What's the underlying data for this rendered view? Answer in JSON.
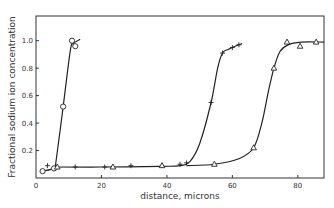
{
  "chart_data": {
    "type": "scatter",
    "title": "",
    "xlabel": "distance, microns",
    "ylabel": "Fractional sodium ion concentration",
    "xlim": [
      0,
      88
    ],
    "ylim": [
      0,
      1.18
    ],
    "xticks": [
      0,
      20,
      40,
      60,
      80
    ],
    "xtick_labels": [
      "0",
      "20",
      "40",
      "60",
      "80"
    ],
    "yticks": [
      0.2,
      0.4,
      0.6,
      0.8,
      1.0
    ],
    "ytick_labels": [
      "0.2",
      "0.4",
      "0.6",
      "0.8",
      "1.0"
    ],
    "grid": false,
    "legend": null,
    "series": [
      {
        "name": "circles",
        "marker": "circle",
        "points": [
          [
            2,
            0.05
          ],
          [
            5.5,
            0.07
          ],
          [
            8.3,
            0.52
          ],
          [
            11,
            1.0
          ],
          [
            12,
            0.96
          ]
        ],
        "curve": [
          [
            2,
            0.05
          ],
          [
            5.5,
            0.07
          ],
          [
            6,
            0.1
          ],
          [
            8.3,
            0.52
          ],
          [
            10.5,
            0.93
          ],
          [
            11.5,
            0.98
          ],
          [
            13.5,
            1.01
          ]
        ]
      },
      {
        "name": "crosses",
        "marker": "plus",
        "points": [
          [
            3.5,
            0.09
          ],
          [
            12,
            0.08
          ],
          [
            21,
            0.08
          ],
          [
            29,
            0.09
          ],
          [
            44,
            0.1
          ],
          [
            46,
            0.11
          ],
          [
            53.5,
            0.55
          ],
          [
            57,
            0.91
          ],
          [
            60,
            0.95
          ],
          [
            62,
            0.97
          ]
        ],
        "curve": [
          [
            6,
            0.08
          ],
          [
            20,
            0.08
          ],
          [
            38,
            0.085
          ],
          [
            44,
            0.09
          ],
          [
            47,
            0.12
          ],
          [
            50,
            0.25
          ],
          [
            53.5,
            0.55
          ],
          [
            55.5,
            0.8
          ],
          [
            57,
            0.91
          ],
          [
            59,
            0.94
          ],
          [
            63,
            0.98
          ]
        ]
      },
      {
        "name": "triangles",
        "marker": "triangle",
        "points": [
          [
            6.5,
            0.08
          ],
          [
            23.5,
            0.08
          ],
          [
            38.5,
            0.09
          ],
          [
            54.5,
            0.1
          ],
          [
            66.5,
            0.22
          ],
          [
            72.7,
            0.8
          ],
          [
            76.7,
            0.99
          ],
          [
            80.7,
            0.96
          ],
          [
            85.6,
            0.99
          ]
        ],
        "curve": [
          [
            46,
            0.09
          ],
          [
            54.5,
            0.1
          ],
          [
            62,
            0.14
          ],
          [
            66.5,
            0.22
          ],
          [
            69,
            0.4
          ],
          [
            71,
            0.63
          ],
          [
            72.7,
            0.8
          ],
          [
            74.5,
            0.92
          ],
          [
            77,
            0.97
          ],
          [
            81,
            0.99
          ],
          [
            88,
            0.99
          ]
        ]
      }
    ]
  }
}
